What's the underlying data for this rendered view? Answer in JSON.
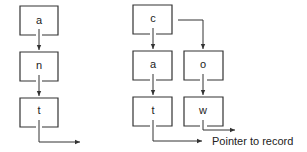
{
  "diagram": {
    "left_trie": {
      "nodes": [
        {
          "label": "a"
        },
        {
          "label": "n"
        },
        {
          "label": "t"
        }
      ]
    },
    "right_trie": {
      "nodes": [
        {
          "label": "c"
        },
        {
          "label": "a"
        },
        {
          "label": "t"
        },
        {
          "label": "o"
        },
        {
          "label": "w"
        }
      ]
    },
    "caption": "Pointer to record"
  }
}
